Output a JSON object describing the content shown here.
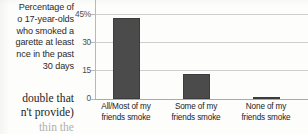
{
  "caption": {
    "lines": [
      "Percentage of",
      "o 17-year-olds",
      "who smoked a",
      "garette at least",
      "nce in the past",
      "30 days"
    ]
  },
  "prose": {
    "lines": [
      "double that",
      "n't provide)",
      "thin the"
    ]
  },
  "chart_data": {
    "type": "bar",
    "title": "",
    "subtitle": "",
    "xlabel": "",
    "ylabel": "",
    "categories": [
      "All/Most of my friends smoke",
      "Some of my friends smoke",
      "None of my friends smoke"
    ],
    "category_lines": [
      [
        "All/Most of my",
        "friends smoke"
      ],
      [
        "Some of my",
        "friends smoke"
      ],
      [
        "None of my",
        "friends smoke"
      ]
    ],
    "values": [
      43,
      13,
      1
    ],
    "ylim": [
      0,
      45
    ],
    "yticks": [
      0,
      15,
      30,
      45
    ],
    "ytick_labels": [
      "0",
      "15",
      "30",
      "45%"
    ],
    "grid": true,
    "legend": "none",
    "bar_color": "#4b4b4b",
    "grid_color": "#cfcfcb",
    "axis_color": "#a9a9a5"
  }
}
